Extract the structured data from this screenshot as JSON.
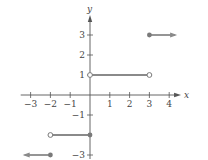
{
  "chart_data": {
    "type": "line",
    "title": "",
    "xlabel": "x",
    "ylabel": "y",
    "xlim": [
      -3.5,
      4.6
    ],
    "ylim": [
      -3.2,
      4.0
    ],
    "grid": false,
    "x_ticks": [
      -3,
      -2,
      -1,
      1,
      2,
      3,
      4
    ],
    "x_tick_labels": [
      "−3",
      "−2",
      "−1",
      "1",
      "2",
      "3",
      "4"
    ],
    "y_ticks": [
      -3,
      -1,
      1,
      2,
      3
    ],
    "y_tick_labels": [
      "−3",
      "−1",
      "1",
      "2",
      "3"
    ],
    "y_minor_ticks": [
      -2
    ],
    "segments": [
      {
        "name": "left-ray",
        "x_start": -3.3,
        "x_end": -2,
        "y": -3,
        "start": "arrow",
        "end": "closed"
      },
      {
        "name": "segment-neg2-to-0",
        "x_start": -2,
        "x_end": 0,
        "y": -2,
        "start": "open",
        "end": "closed"
      },
      {
        "name": "segment-0-to-3",
        "x_start": 0,
        "x_end": 3,
        "y": 1,
        "start": "open",
        "end": "open"
      },
      {
        "name": "right-ray",
        "x_start": 3,
        "x_end": 4.3,
        "y": 3,
        "start": "closed",
        "end": "arrow"
      }
    ],
    "colors": {
      "axis": "#555555",
      "graph": "#8a8a8a",
      "point": "#7a7a7a"
    }
  }
}
